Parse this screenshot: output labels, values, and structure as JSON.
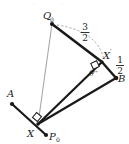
{
  "figure": {
    "title_fragment": "",
    "background_color": "#ffffff",
    "ink_color": "#1a1a1a",
    "thin_line_color": "#a8a8a8",
    "dash_color": "#9a9a9a",
    "width": 129,
    "height": 144
  },
  "points": [
    {
      "id": "Q0",
      "label": "Q",
      "subscript": "0",
      "x": 52,
      "y": 24,
      "label_x": 46,
      "label_y": 15
    },
    {
      "id": "Xp",
      "label": "X",
      "prime": "′",
      "x": 102,
      "y": 62,
      "label_x": 105,
      "label_y": 59
    },
    {
      "id": "B",
      "label": "B",
      "subscript": "",
      "x": 116,
      "y": 78,
      "label_x": 119,
      "label_y": 81
    },
    {
      "id": "A",
      "label": "A",
      "subscript": "",
      "x": 12,
      "y": 104,
      "label_x": 9,
      "label_y": 97
    },
    {
      "id": "X",
      "label": "X",
      "subscript": "",
      "x": 38,
      "y": 124,
      "label_x": 29,
      "label_y": 135
    },
    {
      "id": "P0",
      "label": "P",
      "subscript": "0",
      "x": 46,
      "y": 135,
      "label_x": 49,
      "label_y": 139
    }
  ],
  "segments": [
    {
      "name": "Q0-to-Xprime",
      "from": "Q0",
      "to": "Xp",
      "style": "thick"
    },
    {
      "name": "Xprime-to-B",
      "from": "Xp",
      "to": "B",
      "style": "thick"
    },
    {
      "name": "X-to-Xprime",
      "from": "X",
      "to": "Xp",
      "style": "thick"
    },
    {
      "name": "X-to-B",
      "from": "X",
      "to": "B",
      "style": "thick"
    },
    {
      "name": "A-to-P0",
      "from": "A",
      "to": "P0",
      "style": "thick"
    },
    {
      "name": "Q0-to-X",
      "from": "Q0",
      "to": "X",
      "style": "thin-gray"
    }
  ],
  "arc": {
    "name": "radius-arc-Q0-to-Xprime",
    "style": "dashed",
    "label_numerator": "3",
    "label_denominator": "2"
  },
  "labels": {
    "length_three_halves": {
      "numerator": "3",
      "denominator": "2",
      "x": 88,
      "y": 31
    },
    "length_one_half": {
      "numerator": "1",
      "denominator": "2",
      "x": 121,
      "y": 63
    },
    "angle_theta": {
      "text": "θ′′",
      "x": 95,
      "y": 73
    }
  },
  "right_angles": [
    {
      "name": "right-angle-at-Xprime",
      "at": "Xp",
      "x": 95,
      "y": 64
    },
    {
      "name": "right-angle-at-X",
      "at": "X",
      "x": 37,
      "y": 117
    }
  ]
}
